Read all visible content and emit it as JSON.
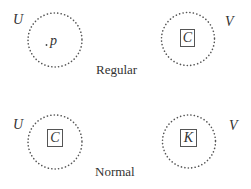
{
  "diagram": {
    "colors": {
      "dots": "#555555",
      "text": "#333333",
      "box_border": "#555555"
    },
    "rows": [
      {
        "caption": "Regular",
        "left_set": {
          "label": "U",
          "content_type": "point",
          "content": "p"
        },
        "right_set": {
          "label": "V",
          "content_type": "boxed",
          "content": "C"
        }
      },
      {
        "caption": "Normal",
        "left_set": {
          "label": "U",
          "content_type": "boxed",
          "content": "C"
        },
        "right_set": {
          "label": "V",
          "content_type": "boxed",
          "content": "K"
        }
      }
    ]
  }
}
